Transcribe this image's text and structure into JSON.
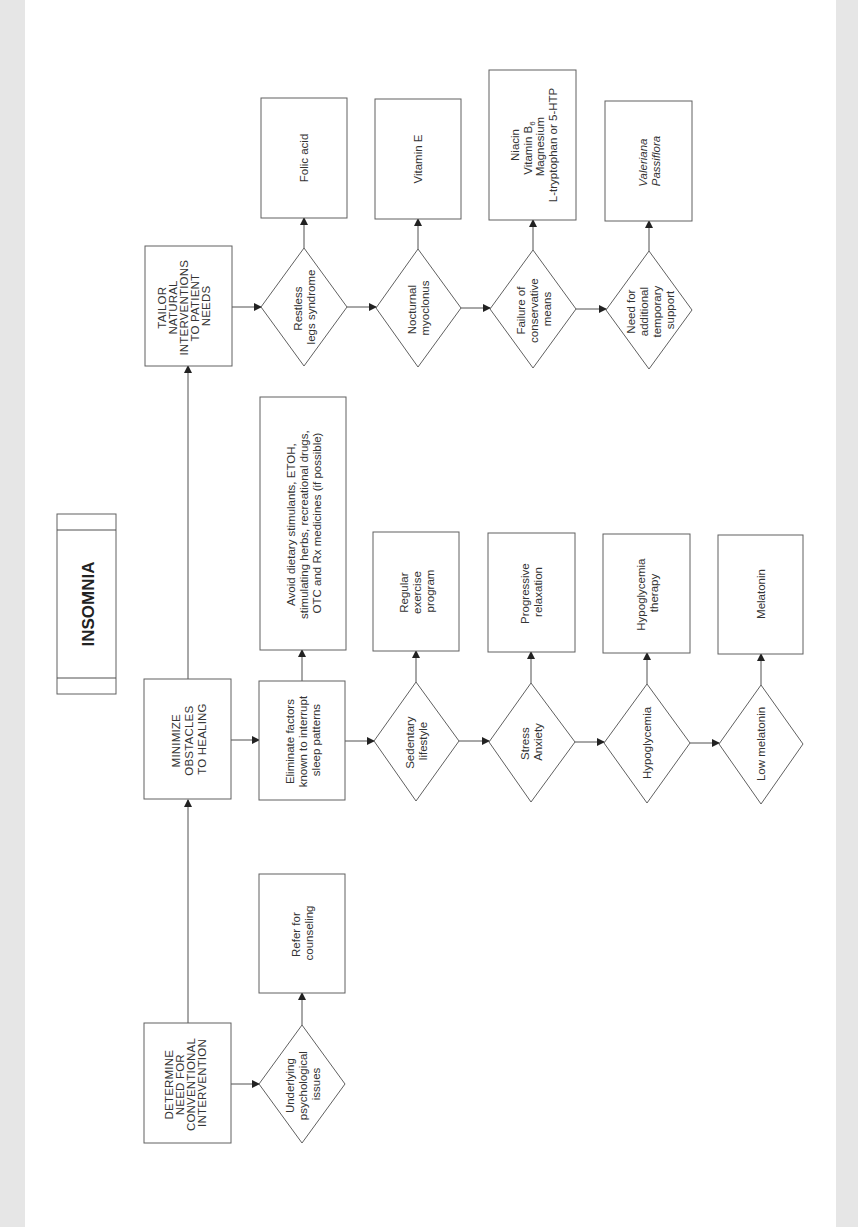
{
  "title": "INSOMNIA",
  "colors": {
    "background": "#ffffff",
    "margin": "#e6e6e6",
    "stroke": "#606060",
    "text": "#333333"
  },
  "orientation": "rotated -90deg (text reads bottom-to-top)",
  "columns": {
    "determine": {
      "header": [
        "DETERMINE",
        "NEED FOR",
        "CONVENTIONAL",
        "INTERVENTION"
      ],
      "condition": [
        "Underlying",
        "psychological",
        "issues"
      ],
      "action": [
        "Refer for",
        "counseling"
      ]
    },
    "minimize": {
      "header": [
        "MINIMIZE",
        "OBSTACLES",
        "TO HEALING"
      ],
      "step": [
        "Eliminate factors",
        "known to interrupt",
        "sleep patterns"
      ],
      "step_action": [
        "Avoid dietary stimulants,  ETOH,",
        "stimulating herbs,  recreational drugs,",
        "OTC and Rx medicines (if possible)"
      ],
      "conditions": [
        {
          "condition": [
            "Sedentary",
            "lifestyle"
          ],
          "action": [
            "Regular",
            "exercise",
            "program"
          ]
        },
        {
          "condition": [
            "Stress",
            "Anxiety"
          ],
          "action": [
            "Progressive",
            "relaxation"
          ]
        },
        {
          "condition": [
            "Hypoglycemia"
          ],
          "action": [
            "Hypoglycemia",
            "therapy"
          ]
        },
        {
          "condition": [
            "Low melatonin"
          ],
          "action": [
            "Melatonin"
          ]
        }
      ]
    },
    "tailor": {
      "header": [
        "TAILOR",
        "NATURAL",
        "INTERVENTIONS",
        "TO PATIENT",
        "NEEDS"
      ],
      "conditions": [
        {
          "condition": [
            "Restless",
            "legs syndrome"
          ],
          "action": [
            "Folic acid"
          ],
          "italic": false
        },
        {
          "condition": [
            "Nocturnal",
            "myoclonus"
          ],
          "action": [
            "Vitamin E"
          ],
          "italic": false
        },
        {
          "condition": [
            "Failure of",
            "conservative",
            "means"
          ],
          "action": [
            "Niacin",
            "Vitamin B",
            "Magnesium",
            "L-tryptophan or 5-HTP"
          ],
          "subscript": "6",
          "italic": false
        },
        {
          "condition": [
            "Need for",
            "additional",
            "temporary",
            "support"
          ],
          "action": [
            "Valeriana",
            "Passiflora"
          ],
          "italic": true
        }
      ]
    }
  }
}
